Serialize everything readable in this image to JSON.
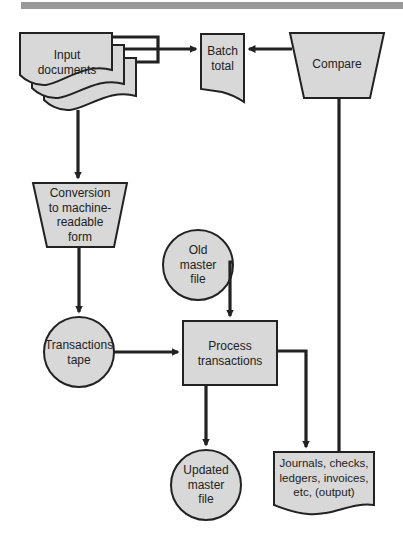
{
  "diagram": {
    "type": "flowchart",
    "title_bar": "",
    "colors": {
      "fill": "#d8d8d8",
      "stroke": "#222222",
      "bar": "#9a9a9a"
    },
    "nodes": {
      "input_documents": {
        "shape": "multi-document",
        "label_line1": "Input",
        "label_line2": "documents"
      },
      "batch_total": {
        "shape": "document",
        "label_line1": "Batch",
        "label_line2": "total"
      },
      "compare": {
        "shape": "manual-operation",
        "label_line1": "Compare"
      },
      "conversion": {
        "shape": "manual-operation",
        "label_line1": "Conversion",
        "label_line2": "to machine-",
        "label_line3": "readable",
        "label_line4": "form"
      },
      "old_master_file": {
        "shape": "circle",
        "label_line1": "Old",
        "label_line2": "master",
        "label_line3": "file"
      },
      "transactions_tape": {
        "shape": "circle",
        "label_line1": "Transactions",
        "label_line2": "tape"
      },
      "process_transactions": {
        "shape": "process",
        "label_line1": "Process",
        "label_line2": "transactions"
      },
      "updated_master_file": {
        "shape": "circle",
        "label_line1": "Updated",
        "label_line2": "master",
        "label_line3": "file"
      },
      "output": {
        "shape": "document",
        "label_line1": "Journals, checks,",
        "label_line2": "ledgers, invoices,",
        "label_line3": "etc, (output)"
      }
    },
    "edges": [
      {
        "from": "input_documents",
        "to": "batch_total"
      },
      {
        "from": "compare",
        "to": "batch_total"
      },
      {
        "from": "input_documents",
        "to": "conversion"
      },
      {
        "from": "conversion",
        "to": "transactions_tape"
      },
      {
        "from": "old_master_file",
        "to": "process_transactions"
      },
      {
        "from": "transactions_tape",
        "to": "process_transactions"
      },
      {
        "from": "process_transactions",
        "to": "updated_master_file"
      },
      {
        "from": "process_transactions",
        "to": "output"
      },
      {
        "from": "output",
        "to": "compare"
      }
    ]
  }
}
